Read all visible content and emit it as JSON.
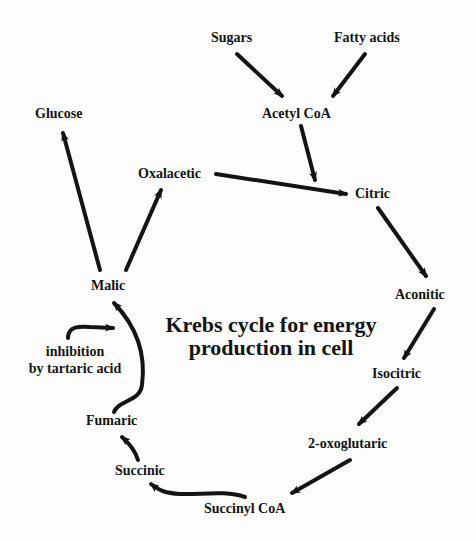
{
  "diagram": {
    "title_line1": "Krebs cycle for energy",
    "title_line2": "production in cell",
    "nodes": {
      "sugars": "Sugars",
      "fatty_acids": "Fatty acids",
      "acetyl_coa": "Acetyl CoA",
      "glucose": "Glucose",
      "oxalacetic": "Oxalacetic",
      "citric": "Citric",
      "malic": "Malic",
      "aconitic": "Aconitic",
      "isocitric": "Isocitric",
      "fumaric": "Fumaric",
      "oxoglutaric": "2-oxoglutaric",
      "succinic": "Succinic",
      "succinyl_coa": "Succinyl CoA"
    },
    "annotation": {
      "line1": "inhibition",
      "line2": "by tartaric acid"
    },
    "edges": [
      {
        "from": "Sugars",
        "to": "Acetyl CoA"
      },
      {
        "from": "Fatty acids",
        "to": "Acetyl CoA"
      },
      {
        "from": "Acetyl CoA",
        "to": "Citric"
      },
      {
        "from": "Oxalacetic",
        "to": "Citric"
      },
      {
        "from": "Citric",
        "to": "Aconitic"
      },
      {
        "from": "Aconitic",
        "to": "Isocitric"
      },
      {
        "from": "Isocitric",
        "to": "2-oxoglutaric"
      },
      {
        "from": "2-oxoglutaric",
        "to": "Succinyl CoA"
      },
      {
        "from": "Succinyl CoA",
        "to": "Succinic"
      },
      {
        "from": "Succinic",
        "to": "Fumaric"
      },
      {
        "from": "Fumaric",
        "to": "Malic"
      },
      {
        "from": "Malic",
        "to": "Oxalacetic"
      },
      {
        "from": "Malic",
        "to": "Glucose"
      },
      {
        "from": "inhibition by tartaric acid",
        "to": "Fumaric-Malic step"
      }
    ],
    "colors": {
      "ink": "#141414",
      "background": "#fdfdfd"
    }
  }
}
